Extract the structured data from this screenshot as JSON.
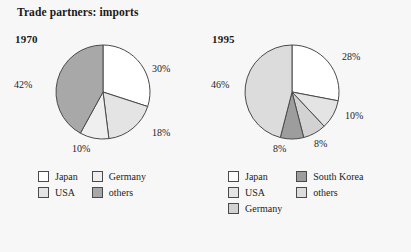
{
  "title": "Trade partners: imports",
  "colors": {
    "background": "#f7f7f7",
    "outline": "#4a4a4a",
    "text": "#1d1d1d",
    "japan": "#ffffff",
    "usa": "#e4e4e4",
    "germany_1970": "#efefef",
    "germany_1995": "#d2d2d2",
    "south_korea": "#9d9d9d",
    "others_1970": "#a8a8a8",
    "others_1995": "#dcdcdc"
  },
  "chart_data": [
    {
      "type": "pie",
      "title": "1970",
      "categories": [
        "Japan",
        "USA",
        "Germany",
        "others"
      ],
      "values": [
        30,
        18,
        10,
        42
      ],
      "labels": [
        "30%",
        "18%",
        "10%",
        "42%"
      ],
      "colors": [
        "#ffffff",
        "#e4e4e4",
        "#efefef",
        "#a8a8a8"
      ],
      "legend_position": "bottom",
      "start_angle_deg": 0,
      "units": "percent"
    },
    {
      "type": "pie",
      "title": "1995",
      "categories": [
        "Japan",
        "USA",
        "Germany",
        "South Korea",
        "others"
      ],
      "values": [
        28,
        10,
        8,
        8,
        46
      ],
      "labels": [
        "28%",
        "10%",
        "8%",
        "8%",
        "46%"
      ],
      "colors": [
        "#ffffff",
        "#e4e4e4",
        "#d2d2d2",
        "#9d9d9d",
        "#dcdcdc"
      ],
      "legend_position": "bottom",
      "start_angle_deg": 0,
      "units": "percent"
    }
  ],
  "pie_1970": {
    "year": "1970",
    "slices": [
      {
        "label": "30%",
        "value": 30,
        "category": "Japan"
      },
      {
        "label": "18%",
        "value": 18,
        "category": "USA"
      },
      {
        "label": "10%",
        "value": 10,
        "category": "Germany"
      },
      {
        "label": "42%",
        "value": 42,
        "category": "others"
      }
    ],
    "legend": [
      {
        "label": "Japan"
      },
      {
        "label": "USA"
      },
      {
        "label": "Germany"
      },
      {
        "label": "others"
      }
    ]
  },
  "pie_1995": {
    "year": "1995",
    "slices": [
      {
        "label": "28%",
        "value": 28,
        "category": "Japan"
      },
      {
        "label": "10%",
        "value": 10,
        "category": "USA"
      },
      {
        "label": "8%",
        "value": 8,
        "category": "Germany"
      },
      {
        "label": "8%",
        "value": 8,
        "category": "South Korea"
      },
      {
        "label": "46%",
        "value": 46,
        "category": "others"
      }
    ],
    "legend": [
      {
        "label": "Japan"
      },
      {
        "label": "USA"
      },
      {
        "label": "Germany"
      },
      {
        "label": "South Korea"
      },
      {
        "label": "others"
      }
    ]
  }
}
